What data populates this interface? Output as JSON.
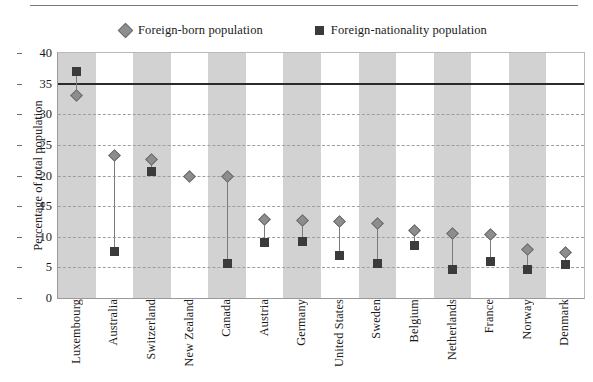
{
  "chart_data": {
    "type": "scatter",
    "title": "",
    "xlabel": "",
    "ylabel": "Percentage of total population",
    "ylim": [
      0,
      40
    ],
    "yticks": [
      0,
      5,
      10,
      15,
      20,
      25,
      30,
      35,
      40
    ],
    "grid": true,
    "legend_position": "top",
    "categories": [
      "Luxembourg",
      "Australia",
      "Switzerland",
      "New Zealand",
      "Canada",
      "Austria",
      "Germany",
      "United States",
      "Sweden",
      "Belgium",
      "Netherlands",
      "France",
      "Norway",
      "Denmark"
    ],
    "series": [
      {
        "name": "Foreign-born population",
        "marker": "diamond",
        "color": "#8d8d8d",
        "values": [
          33.0,
          23.2,
          22.6,
          19.9,
          19.8,
          12.8,
          12.6,
          12.5,
          12.2,
          11.1,
          10.5,
          10.4,
          7.9,
          7.4
        ]
      },
      {
        "name": "Foreign-nationality population",
        "marker": "square",
        "color": "#3b3b3b",
        "values": [
          37.0,
          7.6,
          20.7,
          null,
          5.6,
          9.1,
          9.2,
          7.0,
          5.6,
          8.6,
          4.7,
          6.0,
          4.7,
          5.5
        ]
      }
    ],
    "reference_line": {
      "value": 35.0,
      "color": "#2b2b2b",
      "width": 2
    },
    "band_color": "#d2d2d2",
    "plot_background": "#ffffff"
  },
  "legend": {
    "entries": [
      {
        "label": "Foreign-born population",
        "marker": "diamond"
      },
      {
        "label": "Foreign-nationality population",
        "marker": "square"
      }
    ]
  },
  "axes": {
    "y_title": "Percentage of total population"
  }
}
